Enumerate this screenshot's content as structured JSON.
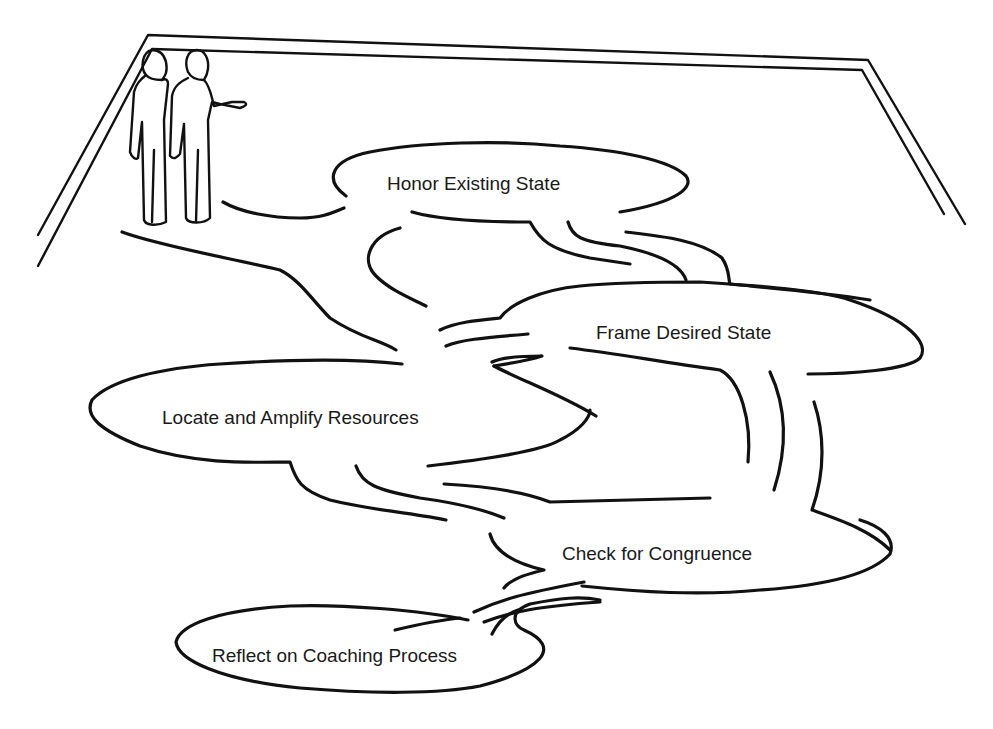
{
  "diagram": {
    "type": "process-path-illustration",
    "figures": {
      "count": 2,
      "label": "coach-and-client-figures"
    },
    "stations": [
      {
        "id": "honor",
        "label": "Honor Existing State",
        "order": 1
      },
      {
        "id": "frame",
        "label": "Frame Desired State",
        "order": 2
      },
      {
        "id": "locate",
        "label": "Locate and Amplify Resources",
        "order": 3
      },
      {
        "id": "check",
        "label": "Check for Congruence",
        "order": 4
      },
      {
        "id": "reflect",
        "label": "Reflect on Coaching Process",
        "order": 5
      }
    ],
    "colors": {
      "ink": "#111111",
      "text": "#1a1a1a",
      "background": "#ffffff"
    }
  }
}
